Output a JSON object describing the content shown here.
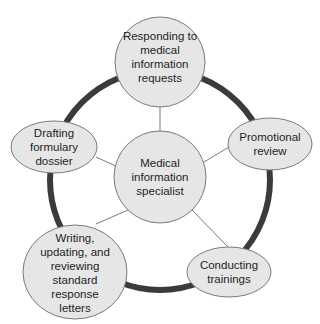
{
  "diagram": {
    "type": "hub-and-spoke cycle",
    "colors": {
      "ring": "#3b3b3b",
      "node_fill": "#e6e6e6",
      "node_stroke": "#7a7a7a",
      "connector": "#7a7a7a",
      "text": "#1e1e1e"
    },
    "center": {
      "lines": [
        "Medical",
        "information",
        "specialist"
      ]
    },
    "nodes": [
      {
        "id": "responding",
        "lines": [
          "Responding to",
          "medical",
          "information",
          "requests"
        ]
      },
      {
        "id": "promotional",
        "lines": [
          "Promotional",
          "review"
        ]
      },
      {
        "id": "trainings",
        "lines": [
          "Conducting",
          "trainings"
        ]
      },
      {
        "id": "writing",
        "lines": [
          "Writing,",
          "updating, and",
          "reviewing",
          "standard",
          "response",
          "letters"
        ]
      },
      {
        "id": "drafting",
        "lines": [
          "Drafting",
          "formulary",
          "dossier"
        ]
      }
    ]
  }
}
